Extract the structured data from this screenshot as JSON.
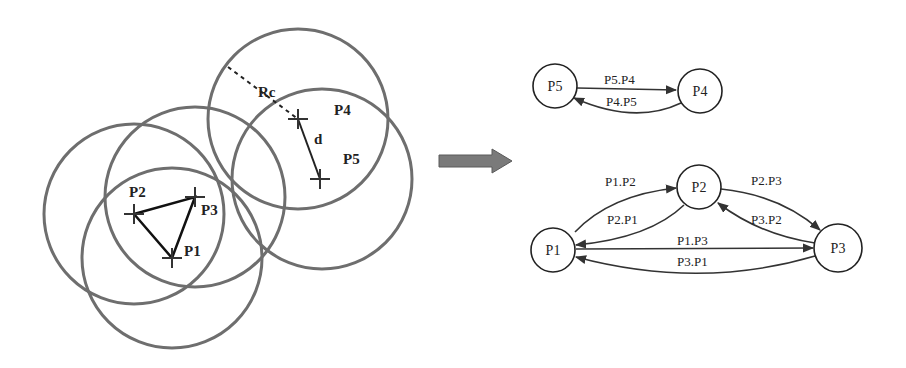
{
  "left_diagram": {
    "nodes": [
      {
        "id": "P1",
        "label": "P1",
        "x": 172,
        "y": 258
      },
      {
        "id": "P2",
        "label": "P2",
        "x": 134,
        "y": 214
      },
      {
        "id": "P3",
        "label": "P3",
        "x": 195,
        "y": 197
      },
      {
        "id": "P4",
        "label": "P4",
        "x": 298,
        "y": 119
      },
      {
        "id": "P5",
        "label": "P5",
        "x": 320,
        "y": 179
      }
    ],
    "range_label": "Rc",
    "distance_label": "d"
  },
  "transition_arrow": {
    "color": "#7a7a7a"
  },
  "right_graph": {
    "top": {
      "nodes": [
        {
          "id": "P5",
          "label": "P5"
        },
        {
          "id": "P4",
          "label": "P4"
        }
      ],
      "edges": [
        {
          "from": "P5",
          "to": "P4",
          "label": "P5.P4"
        },
        {
          "from": "P4",
          "to": "P5",
          "label": "P4.P5"
        }
      ]
    },
    "bottom": {
      "nodes": [
        {
          "id": "P1",
          "label": "P1"
        },
        {
          "id": "P2",
          "label": "P2"
        },
        {
          "id": "P3",
          "label": "P3"
        }
      ],
      "edges": [
        {
          "from": "P1",
          "to": "P2",
          "label": "P1.P2"
        },
        {
          "from": "P2",
          "to": "P1",
          "label": "P2.P1"
        },
        {
          "from": "P2",
          "to": "P3",
          "label": "P2.P3"
        },
        {
          "from": "P3",
          "to": "P2",
          "label": "P3.P2"
        },
        {
          "from": "P1",
          "to": "P3",
          "label": "P1.P3"
        },
        {
          "from": "P3",
          "to": "P1",
          "label": "P3.P1"
        }
      ]
    }
  }
}
